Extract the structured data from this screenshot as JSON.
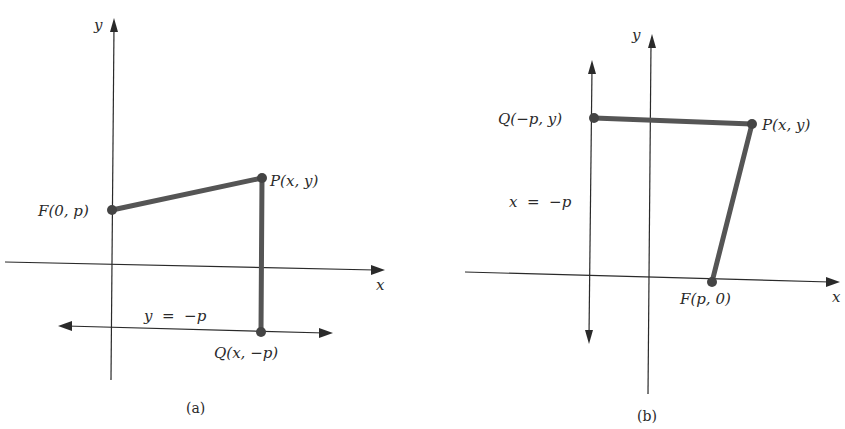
{
  "colors": {
    "ink": "#2a2a2a",
    "segment": "#555555",
    "point": "#444444",
    "background": "#ffffff"
  },
  "figure_a": {
    "caption": "(a)",
    "axis_x_label": "x",
    "axis_y_label": "y",
    "directrix_label": "y  =  −p",
    "points": {
      "F": "F(0, p)",
      "P": "P(x, y)",
      "Q": "Q(x, −p)"
    }
  },
  "figure_b": {
    "caption": "(b)",
    "axis_x_label": "x",
    "axis_y_label": "y",
    "directrix_label": "x  =  −p",
    "points": {
      "Q": "Q(−p, y)",
      "P": "P(x, y)",
      "F": "F(p, 0)"
    }
  }
}
